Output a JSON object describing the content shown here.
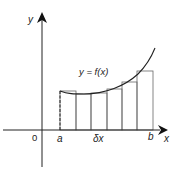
{
  "diagram": {
    "type": "riemann-sum",
    "curve_label": "y = f(x)",
    "axis_labels": {
      "x": "x",
      "y": "y",
      "origin": "0"
    },
    "interval_labels": {
      "start": "a",
      "end": "b",
      "width": "δx"
    },
    "colors": {
      "stroke": "#222222",
      "rect_stroke": "#666666",
      "background": "#ffffff"
    },
    "rect_count": 6
  }
}
